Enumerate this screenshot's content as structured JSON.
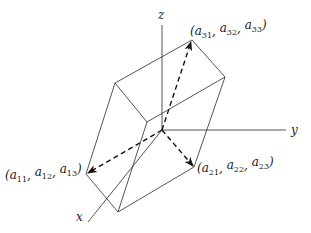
{
  "diagram": {
    "axes": [
      {
        "id": "z",
        "label": "z"
      },
      {
        "id": "y",
        "label": "y"
      },
      {
        "id": "x",
        "label": "x"
      }
    ],
    "vectors": [
      {
        "id": "v1",
        "symbol": "a",
        "components": [
          "a11",
          "a12",
          "a13"
        ],
        "label": "(a11, a12, a13)"
      },
      {
        "id": "v2",
        "symbol": "a",
        "components": [
          "a21",
          "a22",
          "a23"
        ],
        "label": "(a21, a22, a23)"
      },
      {
        "id": "v3",
        "symbol": "a",
        "components": [
          "a31",
          "a32",
          "a33"
        ],
        "label": "(a31, a32, a33)"
      }
    ],
    "vector_style": "dashed-arrow",
    "shape": "parallelepiped"
  }
}
